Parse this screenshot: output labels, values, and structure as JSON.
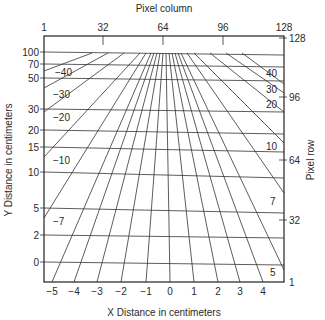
{
  "figure": {
    "top_axis": {
      "title": "Pixel column",
      "ticks": [
        {
          "label": "1",
          "x": 44
        },
        {
          "label": "32",
          "x": 103
        },
        {
          "label": "64",
          "x": 163
        },
        {
          "label": "96",
          "x": 223
        },
        {
          "label": "128",
          "x": 284
        }
      ]
    },
    "right_axis": {
      "title": "Pixel row",
      "ticks": [
        {
          "label": "128",
          "y": 38
        },
        {
          "label": "96",
          "y": 97
        },
        {
          "label": "64",
          "y": 160
        },
        {
          "label": "32",
          "y": 220
        },
        {
          "label": "1",
          "y": 282
        }
      ]
    },
    "left_axis": {
      "title": "Y Distance in centimeters",
      "ticks": [
        {
          "label": "100",
          "yl": 52,
          "yr": 55
        },
        {
          "label": "70",
          "yl": 64,
          "yr": 67
        },
        {
          "label": "50",
          "yl": 78,
          "yr": 81
        },
        {
          "label": "30",
          "yl": 109,
          "yr": 112
        },
        {
          "label": "20",
          "yl": 130,
          "yr": 134
        },
        {
          "label": "15",
          "yl": 147,
          "yr": 152
        },
        {
          "label": "10",
          "yl": 172,
          "yr": 178
        },
        {
          "label": "5",
          "yl": 208,
          "yr": 213
        },
        {
          "label": "2",
          "yl": 235,
          "yr": 238
        },
        {
          "label": "0",
          "yl": 262,
          "yr": 265
        }
      ]
    },
    "bottom_axis": {
      "title": "X Distance in centimeters",
      "ticks": [
        {
          "label": "−5",
          "x": 52
        },
        {
          "label": "−4",
          "x": 74
        },
        {
          "label": "−3",
          "x": 97
        },
        {
          "label": "−2",
          "x": 121
        },
        {
          "label": "−1",
          "x": 146
        },
        {
          "label": "0",
          "x": 170
        },
        {
          "label": "1",
          "x": 194
        },
        {
          "label": "2",
          "x": 218
        },
        {
          "label": "3",
          "x": 240
        },
        {
          "label": "4",
          "x": 263
        }
      ]
    },
    "left_edge_labels": [
      {
        "label": "−40",
        "x": 55,
        "y": 76
      },
      {
        "label": "−30",
        "x": 53,
        "y": 98
      },
      {
        "label": "−20",
        "x": 53,
        "y": 121
      },
      {
        "label": "−10",
        "x": 53,
        "y": 164
      },
      {
        "label": "−7",
        "x": 53,
        "y": 225
      }
    ],
    "right_edge_labels": [
      {
        "label": "40",
        "x": 266,
        "y": 77
      },
      {
        "label": "30",
        "x": 266,
        "y": 93
      },
      {
        "label": "20",
        "x": 266,
        "y": 108
      },
      {
        "label": "10",
        "x": 266,
        "y": 150
      },
      {
        "label": "7",
        "x": 270,
        "y": 205
      },
      {
        "label": "5",
        "x": 270,
        "y": 276
      }
    ],
    "x_lines": [
      {
        "value": "-40",
        "top_x": 92,
        "end": [
          44,
          71
        ]
      },
      {
        "value": "-30",
        "top_x": 108,
        "end": [
          44,
          88
        ]
      },
      {
        "value": "-20",
        "top_x": 124,
        "end": [
          44,
          112
        ]
      },
      {
        "value": "-10",
        "top_x": 140,
        "end": [
          44,
          157
        ]
      },
      {
        "value": "-7",
        "top_x": 146,
        "end": [
          44,
          218
        ]
      },
      {
        "value": "-5",
        "top_x": 151,
        "end": [
          52,
          282
        ]
      },
      {
        "value": "-4",
        "top_x": 154,
        "end": [
          74,
          282
        ]
      },
      {
        "value": "-3",
        "top_x": 157,
        "end": [
          97,
          282
        ]
      },
      {
        "value": "-2",
        "top_x": 160,
        "end": [
          121,
          282
        ]
      },
      {
        "value": "-1",
        "top_x": 163,
        "end": [
          146,
          282
        ]
      },
      {
        "value": "0",
        "top_x": 166,
        "end": [
          170,
          282
        ]
      },
      {
        "value": "1",
        "top_x": 169,
        "end": [
          194,
          282
        ]
      },
      {
        "value": "2",
        "top_x": 172,
        "end": [
          218,
          282
        ]
      },
      {
        "value": "3",
        "top_x": 175,
        "end": [
          240,
          282
        ]
      },
      {
        "value": "4",
        "top_x": 178,
        "end": [
          263,
          282
        ]
      },
      {
        "value": "5",
        "top_x": 181,
        "end": [
          284,
          270
        ]
      },
      {
        "value": "7",
        "top_x": 187,
        "end": [
          284,
          193
        ]
      },
      {
        "value": "10",
        "top_x": 194,
        "end": [
          284,
          143
        ]
      },
      {
        "value": "20",
        "top_x": 210,
        "end": [
          284,
          112
        ]
      },
      {
        "value": "30",
        "top_x": 226,
        "end": [
          284,
          93
        ]
      },
      {
        "value": "40",
        "top_x": 242,
        "end": [
          284,
          84
        ]
      }
    ]
  }
}
